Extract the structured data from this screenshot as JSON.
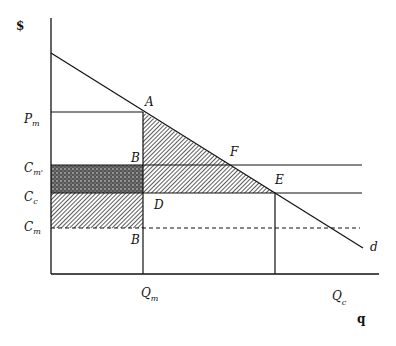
{
  "diagram": {
    "type": "monopoly-vs-competition cost diagram",
    "y_axis_label": "$",
    "x_axis_label": "q",
    "price_labels": {
      "pm": {
        "main": "P",
        "sub": "m"
      },
      "cm_prime": {
        "main": "C",
        "sub": "m'"
      },
      "cc": {
        "main": "C",
        "sub": "c"
      },
      "cm": {
        "main": "C",
        "sub": "m"
      }
    },
    "quantity_labels": {
      "qm": {
        "main": "Q",
        "sub": "m"
      },
      "qc": {
        "main": "Q",
        "sub": "c"
      }
    },
    "points": {
      "A": "A",
      "B_upper": "B",
      "F": "F",
      "E": "E",
      "D": "D",
      "B_lower": "B"
    },
    "curve_label": "d",
    "colors": {
      "line": "#111111",
      "shade": "#555555",
      "background": "#ffffff"
    }
  }
}
